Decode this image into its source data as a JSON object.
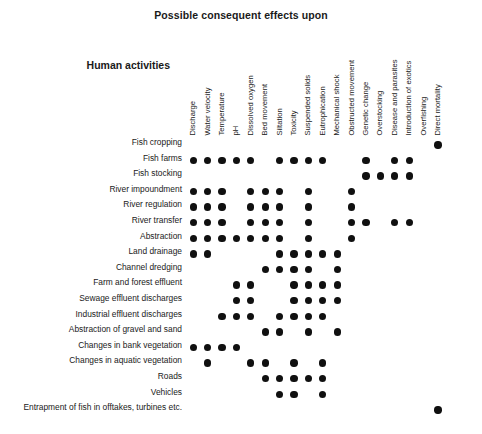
{
  "chart_data": {
    "type": "heatmap",
    "title": "Possible consequent effects upon",
    "row_axis_title": "Human activities",
    "xlabel": "Possible consequent effects upon",
    "ylabel": "Human activities",
    "grid": false,
    "legend": "none",
    "marker": "filled-circle",
    "marker_color": "#101010",
    "background_color": "#ffffff",
    "categories": [
      "Discharge",
      "Water velocity",
      "Temperature",
      "pH",
      "Dissolved oxygen",
      "Bed movement",
      "Siltation",
      "Toxicity",
      "Suspended solids",
      "Eutrophication",
      "Mechanical shock",
      "Obstructed movement",
      "Genetic change",
      "Overstocking",
      "Disease and parasites",
      "Introduction of exotics",
      "Overfishing",
      "Direct mortality"
    ],
    "rows": [
      "Fish cropping",
      "Fish farms",
      "Fish stocking",
      "River impoundment",
      "River regulation",
      "River transfer",
      "Abstraction",
      "Land drainage",
      "Channel dredging",
      "Farm and forest effluent",
      "Sewage effluent discharges",
      "Industrial effluent discharges",
      "Abstraction of gravel and sand",
      "Changes in bank vegetation",
      "Changes in aquatic vegetation",
      "Roads",
      "Vehicles",
      "Entrapment of fish in offtakes, turbines etc."
    ],
    "values": [
      [
        0,
        0,
        0,
        0,
        0,
        0,
        0,
        0,
        0,
        0,
        0,
        0,
        0,
        0,
        0,
        0,
        0,
        1
      ],
      [
        1,
        1,
        1,
        1,
        1,
        0,
        1,
        1,
        1,
        1,
        0,
        0,
        1,
        0,
        1,
        1,
        0,
        0
      ],
      [
        0,
        0,
        0,
        0,
        0,
        0,
        0,
        0,
        0,
        0,
        0,
        0,
        1,
        1,
        1,
        1,
        0,
        0
      ],
      [
        1,
        1,
        1,
        0,
        1,
        1,
        1,
        0,
        1,
        0,
        0,
        1,
        0,
        0,
        0,
        0,
        0,
        0
      ],
      [
        1,
        1,
        1,
        0,
        1,
        1,
        1,
        0,
        1,
        0,
        0,
        1,
        0,
        0,
        0,
        0,
        0,
        0
      ],
      [
        1,
        1,
        1,
        0,
        1,
        1,
        1,
        0,
        1,
        0,
        0,
        1,
        1,
        0,
        1,
        1,
        0,
        0
      ],
      [
        1,
        1,
        1,
        1,
        1,
        1,
        1,
        0,
        1,
        0,
        0,
        1,
        0,
        0,
        0,
        0,
        0,
        0
      ],
      [
        1,
        1,
        0,
        0,
        0,
        0,
        1,
        1,
        1,
        1,
        1,
        0,
        0,
        0,
        0,
        0,
        0,
        0
      ],
      [
        0,
        0,
        0,
        0,
        0,
        1,
        1,
        1,
        1,
        0,
        1,
        0,
        0,
        0,
        0,
        0,
        0,
        0
      ],
      [
        0,
        0,
        0,
        1,
        1,
        0,
        0,
        1,
        1,
        1,
        1,
        0,
        0,
        0,
        0,
        0,
        0,
        0
      ],
      [
        0,
        0,
        0,
        1,
        1,
        0,
        0,
        1,
        1,
        1,
        1,
        0,
        0,
        0,
        0,
        0,
        0,
        0
      ],
      [
        0,
        0,
        1,
        1,
        1,
        0,
        1,
        1,
        1,
        1,
        0,
        0,
        0,
        0,
        0,
        0,
        0,
        0
      ],
      [
        0,
        0,
        0,
        0,
        0,
        1,
        1,
        0,
        1,
        0,
        1,
        0,
        0,
        0,
        0,
        0,
        0,
        0
      ],
      [
        1,
        1,
        1,
        1,
        0,
        0,
        0,
        0,
        0,
        0,
        0,
        0,
        0,
        0,
        0,
        0,
        0,
        0
      ],
      [
        0,
        1,
        0,
        0,
        1,
        1,
        0,
        1,
        0,
        1,
        0,
        0,
        0,
        0,
        0,
        0,
        0,
        0
      ],
      [
        0,
        0,
        0,
        0,
        0,
        1,
        1,
        1,
        1,
        1,
        0,
        0,
        0,
        0,
        0,
        0,
        0,
        0
      ],
      [
        0,
        0,
        0,
        0,
        0,
        0,
        1,
        1,
        0,
        1,
        0,
        0,
        0,
        0,
        0,
        0,
        0,
        0
      ],
      [
        0,
        0,
        0,
        0,
        0,
        0,
        0,
        0,
        0,
        0,
        0,
        0,
        0,
        0,
        0,
        0,
        0,
        1
      ]
    ]
  }
}
